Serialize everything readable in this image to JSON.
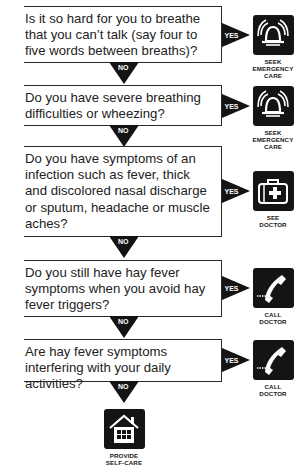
{
  "flowchart": {
    "questions": [
      {
        "text": "Is it so hard for you to breathe that you can’t talk (say four to five words between breaths)?",
        "yes_label": "YES",
        "no_label": "NO",
        "outcome": {
          "icon": "bell-icon",
          "label_lines": [
            "SEEK",
            "EMERGENCY",
            "CARE"
          ]
        }
      },
      {
        "text": "Do you have severe breathing difficulties or wheezing?",
        "yes_label": "YES",
        "no_label": "NO",
        "outcome": {
          "icon": "bell-icon",
          "label_lines": [
            "SEEK",
            "EMERGENCY",
            "CARE"
          ]
        }
      },
      {
        "text": "Do you have symptoms of an infection such as fever, thick and discolored nasal discharge or sputum, headache or muscle aches?",
        "yes_label": "YES",
        "no_label": "NO",
        "outcome": {
          "icon": "medical-bag-icon",
          "label_lines": [
            "SEE",
            "DOCTOR"
          ]
        }
      },
      {
        "text": "Do you still have hay fever symptoms when you avoid hay fever triggers?",
        "yes_label": "YES",
        "no_label": "NO",
        "outcome": {
          "icon": "phone-icon",
          "label_lines": [
            "CALL",
            "DOCTOR"
          ]
        }
      },
      {
        "text": "Are hay fever symptoms interfering with your daily activities?",
        "yes_label": "YES",
        "no_label": "NO",
        "outcome": {
          "icon": "phone-icon",
          "label_lines": [
            "CALL",
            "DOCTOR"
          ]
        }
      }
    ],
    "final_outcome": {
      "icon": "house-icon",
      "label_lines": [
        "PROVIDE",
        "SELF-CARE"
      ]
    },
    "colors": {
      "ink": "#141414",
      "text": "#222222",
      "background": "#ffffff"
    }
  }
}
